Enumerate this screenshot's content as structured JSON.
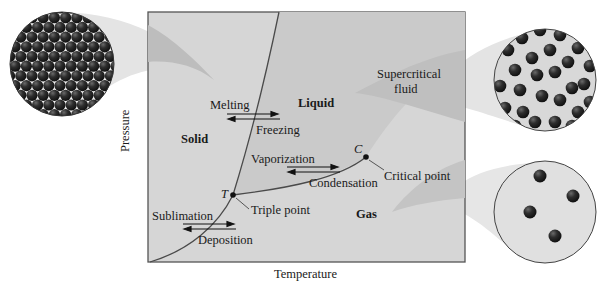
{
  "figure": {
    "top_cut_text": "",
    "axes": {
      "xlabel": "Temperature",
      "ylabel": "Pressure"
    },
    "regions": {
      "solid": "Solid",
      "liquid": "Liquid",
      "gas": "Gas",
      "supercritical_line1": "Supercritical",
      "supercritical_line2": "fluid"
    },
    "points": {
      "triple_symbol": "T",
      "triple_label": "Triple point",
      "critical_symbol": "C",
      "critical_label": "Critical point"
    },
    "transitions": {
      "melting": "Melting",
      "freezing": "Freezing",
      "vaporization": "Vaporization",
      "condensation": "Condensation",
      "sublimation": "Sublimation",
      "deposition": "Deposition"
    },
    "insets": [
      {
        "name": "solid-particles",
        "description": "close-packed particle lattice"
      },
      {
        "name": "supercritical-particles",
        "description": "dense disordered particles"
      },
      {
        "name": "gas-particles",
        "description": "sparse particles",
        "count": 4
      }
    ],
    "colors": {
      "box_fill": "#d6d6d6",
      "liquid_fill": "#c6c6c6",
      "beam_fill": "#bdbdbd",
      "curve": "#4a4a4a",
      "particle": "#2a2a2a",
      "circle_bg": "#dcdcdc"
    }
  }
}
